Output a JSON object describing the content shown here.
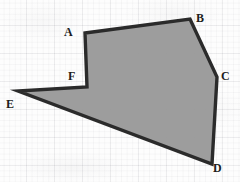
{
  "figure": {
    "canvas": {
      "width": 240,
      "height": 182
    },
    "background": {
      "name": "graph-paper",
      "paper_color": "#fdfdfd",
      "minor_grid_color": "#78788220",
      "major_grid_color": "#78788216",
      "minor_spacing_px": 5.6,
      "major_spacing_px": 28
    },
    "shape": {
      "name": "hexagon-ABCDEF",
      "type": "polygon",
      "fill_color": "#9a9a9a",
      "stroke_color": "#2b2b2b",
      "stroke_width": 3.4,
      "points": "85,33 190,19 217,77 212,164 18,91 87,87",
      "vertices": [
        {
          "id": "A",
          "x": 85,
          "y": 33,
          "label": "A",
          "label_x": 64,
          "label_y": 26
        },
        {
          "id": "B",
          "x": 190,
          "y": 19,
          "label": "B",
          "label_x": 196,
          "label_y": 12
        },
        {
          "id": "C",
          "x": 217,
          "y": 77,
          "label": "C",
          "label_x": 221,
          "label_y": 70
        },
        {
          "id": "D",
          "x": 212,
          "y": 164,
          "label": "D",
          "label_x": 213,
          "label_y": 162
        },
        {
          "id": "E",
          "x": 18,
          "y": 91,
          "label": "E",
          "label_x": 6,
          "label_y": 98
        },
        {
          "id": "F",
          "x": 87,
          "y": 87,
          "label": "F",
          "label_x": 68,
          "label_y": 70
        }
      ],
      "edges": [
        {
          "from": "A",
          "to": "B"
        },
        {
          "from": "B",
          "to": "C"
        },
        {
          "from": "C",
          "to": "D"
        },
        {
          "from": "D",
          "to": "E"
        },
        {
          "from": "E",
          "to": "F"
        },
        {
          "from": "F",
          "to": "A"
        }
      ]
    }
  }
}
